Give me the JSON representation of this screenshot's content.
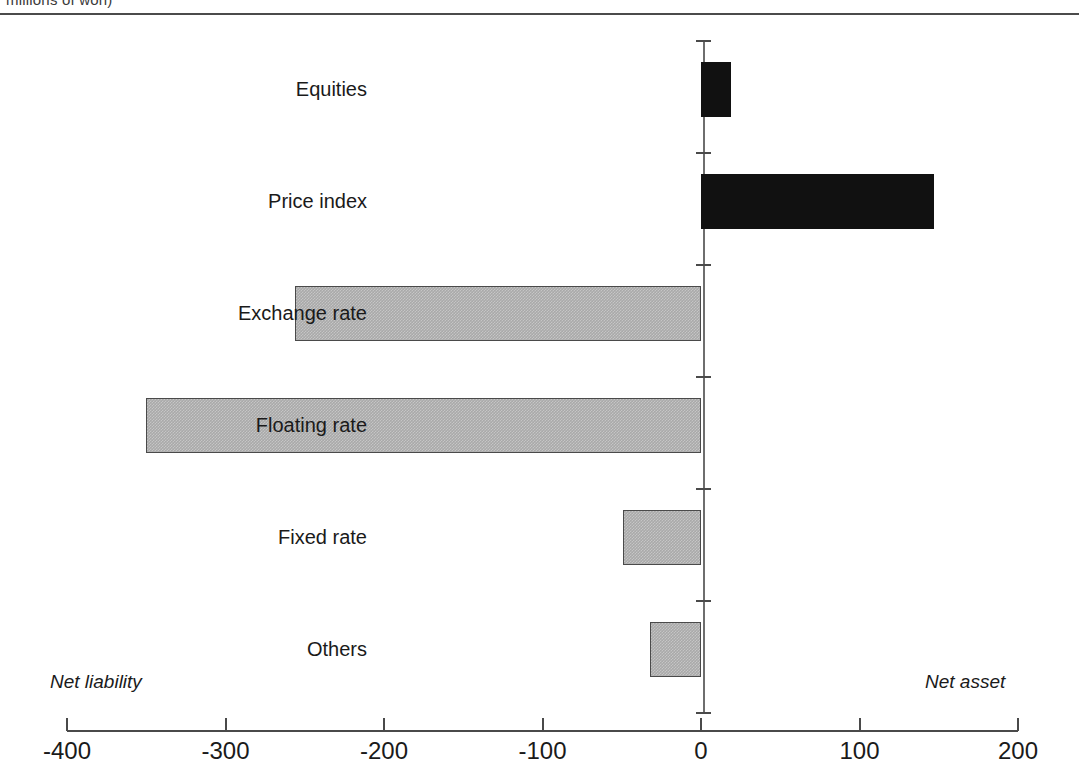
{
  "caption": {
    "text": "millions of won)"
  },
  "annotations": {
    "left": "Net liability",
    "right": "Net asset"
  },
  "colors": {
    "net_asset_bar": "#111111",
    "net_liability_bar": "#a9a9a9",
    "axis": "#4a4a4a",
    "background": "#ffffff"
  },
  "chart_data": {
    "type": "bar",
    "orientation": "horizontal",
    "title": "",
    "subtitle": "",
    "xlabel": "",
    "ylabel": "",
    "xlim": [
      -400,
      200
    ],
    "xticks": [
      -400,
      -300,
      -200,
      -100,
      0,
      100,
      200
    ],
    "xtick_labels": [
      "-400",
      "-300",
      "-200",
      "-100",
      "0",
      "100",
      "200"
    ],
    "grid": false,
    "legend": "none",
    "categories": [
      "Equities",
      "Price index",
      "Exchange rate",
      "Floating rate",
      "Fixed rate",
      "Others"
    ],
    "values": [
      19,
      147,
      -256,
      -350,
      -49,
      -32
    ],
    "bars": [
      {
        "label": "Equities",
        "value": 19,
        "sign": "positive"
      },
      {
        "label": "Price index",
        "value": 147,
        "sign": "positive"
      },
      {
        "label": "Exchange rate",
        "value": -256,
        "sign": "negative"
      },
      {
        "label": "Floating rate",
        "value": -350,
        "sign": "negative"
      },
      {
        "label": "Fixed rate",
        "value": -49,
        "sign": "negative"
      },
      {
        "label": "Others",
        "value": -32,
        "sign": "negative"
      }
    ]
  }
}
